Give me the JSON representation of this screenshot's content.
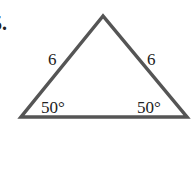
{
  "problem": {
    "number": "5."
  },
  "triangle": {
    "type": "isosceles",
    "stroke_color": "#555555",
    "sides": {
      "left": "6",
      "right": "6"
    },
    "angles": {
      "bottom_left": "50°",
      "bottom_right": "50°"
    },
    "vertices": {
      "apex": [
        103,
        15
      ],
      "bottom_left": [
        20,
        117
      ],
      "bottom_right": [
        188,
        117
      ]
    }
  }
}
